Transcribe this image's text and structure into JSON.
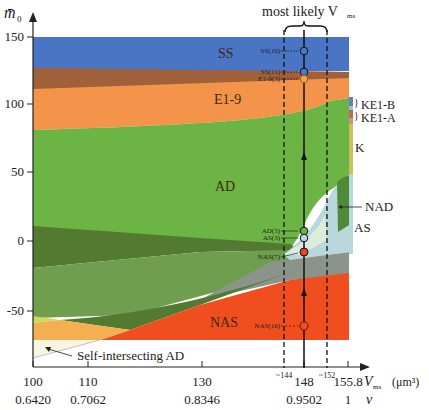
{
  "figure": {
    "y_axis_label": "m̄",
    "y_axis_label_sub": "0",
    "x_axis_label": "V",
    "x_axis_label_sub": "ms",
    "x_axis_unit": "(μm³)",
    "nu_label": "ν",
    "top_annotation": "most likely V",
    "top_annotation_sub": "ms"
  },
  "y_ticks": [
    {
      "value": 150,
      "label": "150",
      "y": 37
    },
    {
      "value": 100,
      "label": "100",
      "y": 104
    },
    {
      "value": 50,
      "label": "50",
      "y": 172
    },
    {
      "value": 0,
      "label": "0",
      "y": 241
    },
    {
      "value": -50,
      "label": "-50",
      "y": 311
    }
  ],
  "x_ticks": [
    {
      "value": 100,
      "label": "100",
      "nu": "0.6420",
      "x": 33
    },
    {
      "value": 110,
      "label": "110",
      "nu": "0.7062",
      "x": 88
    },
    {
      "value": 130,
      "label": "130",
      "nu": "0.8346",
      "x": 202
    },
    {
      "value": 148,
      "label": "148",
      "nu": "0.9502",
      "x": 304
    },
    {
      "value": 155.8,
      "label": "155.8",
      "nu": "1",
      "x": 348
    }
  ],
  "dashed_markers": [
    {
      "label": "~144",
      "x": 284
    },
    {
      "label": "~152",
      "x": 327
    }
  ],
  "regions": {
    "ss": "SS",
    "e19": "E1-9",
    "ad": "AD",
    "nas": "NAS"
  },
  "side_labels": {
    "ke1b": "KE1-B",
    "ke1a": "KE1-A",
    "k": "K",
    "nad": "NAD",
    "as": "AS",
    "self_intersecting": "Self-intersecting AD"
  },
  "points": [
    {
      "label": "SS(10)",
      "y": 51,
      "fill": "#4a78c8"
    },
    {
      "label": "SS(11)",
      "y": 72,
      "fill": "#4a78c8"
    },
    {
      "label": "E1-9(3)",
      "y": 79,
      "fill": "#f4a050"
    },
    {
      "label": "AD(5)",
      "y": 231,
      "fill": "#6ab844"
    },
    {
      "label": "AS(3)",
      "y": 238,
      "fill": "#b8d8e0"
    },
    {
      "label": "NAS(7)",
      "y": 252,
      "fill": "#e84420"
    },
    {
      "label": "NAS(10)",
      "y": 326,
      "fill": "#f05020"
    }
  ],
  "colors": {
    "ss": "#4a74c4",
    "brown": "#a0603a",
    "e19": "#f4944a",
    "ad": "#6cb444",
    "dark_green": "#527a30",
    "mid_green": "#6e9e4e",
    "grey": "#8a948a",
    "nas": "#f04e1e",
    "light_orange": "#f4b050",
    "yellow_green": "#c8d860",
    "cream": "#f8f6e0",
    "as_light": "#b8d8dc",
    "nad": "#4e8a38",
    "k": "#c8c060"
  }
}
